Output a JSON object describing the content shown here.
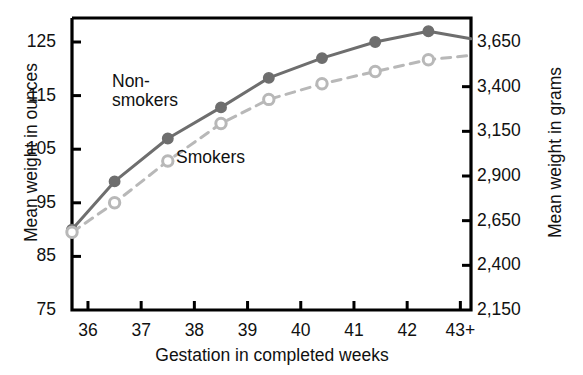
{
  "chart_data": {
    "type": "line",
    "title": "",
    "xlabel": "Gestation in completed weeks",
    "ylabel": "Mean weight in ounces",
    "ylabel_secondary": "Mean weight in grams",
    "x": [
      35.7,
      36.5,
      37.5,
      38.5,
      39.4,
      40.4,
      41.4,
      42.4,
      43.2
    ],
    "xtick_labels": [
      "36",
      "37",
      "38",
      "39",
      "40",
      "41",
      "42",
      "43+"
    ],
    "xticks": [
      36,
      37,
      38,
      39,
      40,
      41,
      42,
      43
    ],
    "yticks_left": [
      75,
      85,
      95,
      105,
      115,
      125
    ],
    "ytick_labels_left": [
      "75",
      "85",
      "95",
      "105",
      "115",
      "125"
    ],
    "ylim_left": [
      75,
      130
    ],
    "yticks_right": [
      2150,
      2400,
      2650,
      2900,
      3150,
      3400,
      3650
    ],
    "ytick_labels_right": [
      "2,150",
      "2,400",
      "2,650",
      "2,900",
      "3,150",
      "3,400",
      "3,650"
    ],
    "ylim_right": [
      2150,
      3700
    ],
    "grid": false,
    "legend": "inline-annotations",
    "series": [
      {
        "name": "Non-smokers",
        "marker": "filled-circle",
        "linestyle": "solid",
        "color": "#6e6e6e",
        "values": [
          90.0,
          99.0,
          107.0,
          112.8,
          118.3,
          122.0,
          125.0,
          127.0,
          125.6
        ]
      },
      {
        "name": "Smokers",
        "marker": "open-circle",
        "linestyle": "dashed",
        "color": "#b8b8b8",
        "values": [
          89.5,
          95.0,
          102.8,
          109.8,
          114.3,
          117.2,
          119.5,
          121.7,
          122.5
        ]
      }
    ],
    "annotations": [
      {
        "text": "Non-\nsmokers",
        "line1": "Non-",
        "line2": "smokers"
      },
      {
        "text": "Smokers"
      }
    ]
  },
  "axes": {
    "left_title": "Mean weight in ounces",
    "right_title": "Mean weight in grams",
    "x_title": "Gestation in completed weeks"
  },
  "labels": {
    "nonsmokers_line1": "Non-",
    "nonsmokers_line2": "smokers",
    "smokers": "Smokers"
  },
  "colors": {
    "nonsmokers": "#6e6e6e",
    "smokers": "#b8b8b8",
    "axis": "#000000",
    "text": "#111111",
    "background": "#ffffff"
  }
}
